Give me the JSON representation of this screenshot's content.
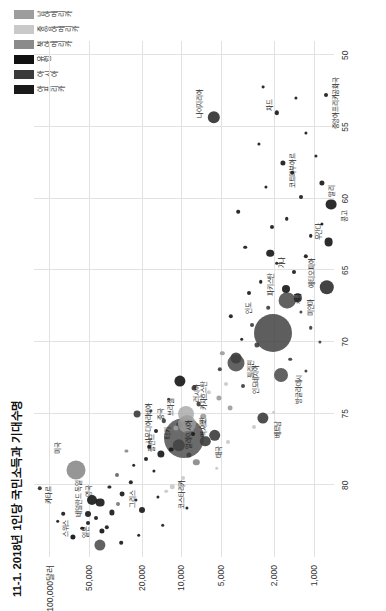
{
  "title": "11-1. 2018년 1인당 국민소득과 기대수명",
  "legend": {
    "position": "top-right",
    "items": [
      {
        "label": "아프리카",
        "color": "#1a1a1a"
      },
      {
        "label": "아시아",
        "color": "#3a3a3a"
      },
      {
        "label": "유럽",
        "color": "#111111"
      },
      {
        "label": "북아메리카",
        "color": "#8a8a8a"
      },
      {
        "label": "중앙아메리카",
        "color": "#c9c9c9"
      },
      {
        "label": "남아메리카",
        "color": "#9d9d9d"
      }
    ]
  },
  "chart_data": {
    "type": "scatter",
    "title": "11-1. 2018년 1인당 국민소득과 기대수명",
    "xlabel": "기대수명",
    "ylabel": "1인당 국민소득",
    "xlim": [
      49,
      85
    ],
    "ylim": [
      700,
      130000
    ],
    "yscale": "log",
    "grid": true,
    "xtick_labels": [
      "80",
      "75",
      "70",
      "65",
      "60",
      "55",
      "50"
    ],
    "xticks": [
      80,
      75,
      70,
      65,
      60,
      55,
      50
    ],
    "ytick_labels": [
      "1,000",
      "2,000",
      "5,000",
      "10,000",
      "20,000",
      "50,000",
      "100,000달러"
    ],
    "yticks": [
      1000,
      2000,
      5000,
      10000,
      20000,
      50000,
      100000
    ],
    "bubble_meaning": "원 크기는 인구 규모",
    "points": [
      {
        "name": "카타르",
        "x": 80.2,
        "y": 118000,
        "r": 2.2,
        "color": "#2b2b2b",
        "label": true,
        "lx": -1.1,
        "ly": 1.35
      },
      {
        "name": "스위스",
        "x": 83.6,
        "y": 66000,
        "r": 2.6,
        "color": "#111111",
        "label": true,
        "lx": 1.3,
        "ly": -1.2
      },
      {
        "name": "미국",
        "x": 78.9,
        "y": 63000,
        "r": 9.5,
        "color": "#7f7f7f",
        "label": true,
        "lx": 1.6,
        "ly": -1.4
      },
      {
        "name": "일본",
        "x": 84.2,
        "y": 41000,
        "r": 5.6,
        "color": "#555555",
        "label": true,
        "lx": 1.4,
        "ly": -1.6
      },
      {
        "name": "독일",
        "x": 81.0,
        "y": 47500,
        "r": 5.0,
        "color": "#1a1a1a",
        "label": true,
        "lx": 1.5,
        "ly": -1.5
      },
      {
        "name": "영국",
        "x": 81.2,
        "y": 41300,
        "r": 4.4,
        "color": "#1a1a1a",
        "label": true,
        "lx": 1.4,
        "ly": -1.4
      },
      {
        "name": "네덜란드",
        "x": 82.0,
        "y": 51000,
        "r": 3.0,
        "color": "#1a1a1a",
        "label": true,
        "lx": 1.3,
        "ly": -1.4
      },
      {
        "name": "그리스",
        "x": 81.7,
        "y": 19800,
        "r": 3.0,
        "color": "#1a1a1a",
        "label": true,
        "lx": 1.5,
        "ly": -1.5
      },
      {
        "name": "사우디아라비아",
        "x": 75.0,
        "y": 21600,
        "r": 3.4,
        "color": "#3f3f3f",
        "label": true,
        "lx": -1.3,
        "ly": 1.5
      },
      {
        "name": "폴란드",
        "x": 77.8,
        "y": 14200,
        "r": 3.6,
        "color": "#1a1a1a",
        "label": true,
        "lx": 1.4,
        "ly": -1.4
      },
      {
        "name": "말레이시아",
        "x": 75.8,
        "y": 10500,
        "r": 3.0,
        "color": "#3f3f3f",
        "label": true,
        "lx": -1.3,
        "ly": 1.4
      },
      {
        "name": "러시아",
        "x": 72.7,
        "y": 10200,
        "r": 5.6,
        "color": "#1a1a1a",
        "label": true,
        "lx": -1.3,
        "ly": 1.6
      },
      {
        "name": "카자흐스탄",
        "x": 73.2,
        "y": 8000,
        "r": 2.5,
        "color": "#3f3f3f",
        "label": true,
        "lx": -1.2,
        "ly": 1.4
      },
      {
        "name": "코스타리카",
        "x": 80.1,
        "y": 11700,
        "r": 2.2,
        "color": "#c9c9c9",
        "label": true,
        "lx": -1.2,
        "ly": 1.4
      },
      {
        "name": "중국",
        "x": 76.7,
        "y": 9500,
        "r": 20.0,
        "color": "#4a4a4a",
        "label": true,
        "lx": 1.0,
        "ly": -1.0
      },
      {
        "name": "터키",
        "x": 77.2,
        "y": 10400,
        "r": 6.2,
        "color": "#3f3f3f",
        "label": true,
        "lx": 1.2,
        "ly": -1.2
      },
      {
        "name": "멕시코",
        "x": 75.0,
        "y": 9200,
        "r": 8.0,
        "color": "#a8a8a8",
        "label": true,
        "lx": -1.2,
        "ly": 1.4
      },
      {
        "name": "태국",
        "x": 76.9,
        "y": 6600,
        "r": 5.2,
        "color": "#3f3f3f",
        "label": true,
        "lx": -1.2,
        "ly": 1.4
      },
      {
        "name": "브라질",
        "x": 75.7,
        "y": 9100,
        "r": 9.0,
        "color": "#9d9d9d",
        "label": true,
        "lx": 1.3,
        "ly": -1.3
      },
      {
        "name": "인도네시아",
        "x": 71.5,
        "y": 3850,
        "r": 8.5,
        "color": "#3f3f3f",
        "label": true,
        "lx": -1.3,
        "ly": 1.5
      },
      {
        "name": "이란",
        "x": 76.5,
        "y": 5600,
        "r": 5.8,
        "color": "#3f3f3f",
        "label": true,
        "lx": 1.2,
        "ly": -1.3
      },
      {
        "name": "인도",
        "x": 69.4,
        "y": 2020,
        "r": 19.0,
        "color": "#3a3a3a",
        "label": true,
        "lx": 1.1,
        "ly": -1.1
      },
      {
        "name": "필리핀",
        "x": 71.1,
        "y": 3830,
        "r": 5.5,
        "color": "#3f3f3f",
        "label": true,
        "lx": -1.2,
        "ly": 1.4
      },
      {
        "name": "베트남",
        "x": 75.3,
        "y": 2400,
        "r": 5.6,
        "color": "#3f3f3f",
        "label": true,
        "lx": -1.2,
        "ly": 1.4
      },
      {
        "name": "방글라데시",
        "x": 72.3,
        "y": 1750,
        "r": 7.0,
        "color": "#3f3f3f",
        "label": true,
        "lx": -1.3,
        "ly": 1.5
      },
      {
        "name": "파키스탄",
        "x": 67.1,
        "y": 1580,
        "r": 8.4,
        "color": "#3f3f3f",
        "label": true,
        "lx": 1.3,
        "ly": -1.4
      },
      {
        "name": "미얀마",
        "x": 66.9,
        "y": 1310,
        "r": 4.2,
        "color": "#3f3f3f",
        "label": true,
        "lx": -1.2,
        "ly": 1.4
      },
      {
        "name": "나이지리아",
        "x": 54.3,
        "y": 5700,
        "r": 6.2,
        "color": "#1a1a1a",
        "label": true,
        "lx": 1.3,
        "ly": -1.4
      },
      {
        "name": "케냐",
        "x": 66.3,
        "y": 1620,
        "r": 4.0,
        "color": "#1a1a1a",
        "label": true,
        "lx": -1.2,
        "ly": 1.4
      },
      {
        "name": "코트디부아르",
        "x": 57.5,
        "y": 1700,
        "r": 2.6,
        "color": "#1a1a1a",
        "label": true,
        "lx": -1.2,
        "ly": 1.4
      },
      {
        "name": "가나",
        "x": 63.8,
        "y": 2130,
        "r": 3.8,
        "color": "#1a1a1a",
        "label": true,
        "lx": -1.2,
        "ly": 1.4
      },
      {
        "name": "에티오피아",
        "x": 66.2,
        "y": 790,
        "r": 7.2,
        "color": "#1a1a1a",
        "label": true,
        "lx": 1.3,
        "ly": -1.4
      },
      {
        "name": "우간다",
        "x": 63.0,
        "y": 770,
        "r": 4.4,
        "color": "#1a1a1a",
        "label": true,
        "lx": 1.2,
        "ly": -1.3
      },
      {
        "name": "콩고",
        "x": 60.4,
        "y": 740,
        "r": 5.4,
        "color": "#1a1a1a",
        "label": true,
        "lx": -1.2,
        "ly": 1.4
      },
      {
        "name": "말리",
        "x": 58.9,
        "y": 870,
        "r": 2.6,
        "color": "#1a1a1a",
        "label": true,
        "lx": -1.2,
        "ly": 1.4
      },
      {
        "name": "차드",
        "x": 54.0,
        "y": 1900,
        "r": 2.2,
        "color": "#1a1a1a",
        "label": true,
        "lx": 1.2,
        "ly": -1.3
      },
      {
        "name": "중앙아프리카공화국",
        "x": 52.8,
        "y": 800,
        "r": 2.0,
        "color": "#1a1a1a",
        "label": true,
        "lx": -1.3,
        "ly": 1.5
      },
      {
        "name": "",
        "x": 82.5,
        "y": 86000,
        "r": 1.8,
        "color": "#1a1a1a",
        "label": false
      },
      {
        "name": "",
        "x": 82.0,
        "y": 78000,
        "r": 1.8,
        "color": "#1a1a1a",
        "label": false
      },
      {
        "name": "",
        "x": 83.0,
        "y": 56000,
        "r": 1.8,
        "color": "#1a1a1a",
        "label": false
      },
      {
        "name": "",
        "x": 82.6,
        "y": 50500,
        "r": 2.0,
        "color": "#1a1a1a",
        "label": false
      },
      {
        "name": "",
        "x": 82.3,
        "y": 44000,
        "r": 2.0,
        "color": "#1a1a1a",
        "label": false
      },
      {
        "name": "",
        "x": 83.2,
        "y": 40000,
        "r": 2.6,
        "color": "#141414",
        "label": false
      },
      {
        "name": "",
        "x": 82.9,
        "y": 36500,
        "r": 2.2,
        "color": "#1a1a1a",
        "label": false
      },
      {
        "name": "",
        "x": 81.9,
        "y": 33500,
        "r": 2.6,
        "color": "#1a1a1a",
        "label": false
      },
      {
        "name": "",
        "x": 81.3,
        "y": 30000,
        "r": 2.0,
        "color": "#777777",
        "label": false
      },
      {
        "name": "",
        "x": 80.6,
        "y": 28000,
        "r": 2.4,
        "color": "#1a1a1a",
        "label": false
      },
      {
        "name": "",
        "x": 80.1,
        "y": 35000,
        "r": 1.6,
        "color": "#1a1a1a",
        "label": false
      },
      {
        "name": "",
        "x": 79.3,
        "y": 30500,
        "r": 2.0,
        "color": "#666666",
        "label": false
      },
      {
        "name": "",
        "x": 79.8,
        "y": 24000,
        "r": 2.2,
        "color": "#1a1a1a",
        "label": false
      },
      {
        "name": "",
        "x": 78.6,
        "y": 23000,
        "r": 1.8,
        "color": "#1a1a1a",
        "label": false
      },
      {
        "name": "",
        "x": 81.0,
        "y": 22000,
        "r": 1.6,
        "color": "#1a1a1a",
        "label": false
      },
      {
        "name": "",
        "x": 78.2,
        "y": 18500,
        "r": 2.0,
        "color": "#1a1a1a",
        "label": false
      },
      {
        "name": "",
        "x": 77.3,
        "y": 17500,
        "r": 1.8,
        "color": "#1a1a1a",
        "label": false
      },
      {
        "name": "",
        "x": 79.0,
        "y": 16000,
        "r": 1.6,
        "color": "#1a1a1a",
        "label": false
      },
      {
        "name": "",
        "x": 76.2,
        "y": 15500,
        "r": 2.0,
        "color": "#1a1a1a",
        "label": false
      },
      {
        "name": "",
        "x": 80.8,
        "y": 15000,
        "r": 1.6,
        "color": "#1a1a1a",
        "label": false
      },
      {
        "name": "",
        "x": 75.5,
        "y": 13500,
        "r": 2.2,
        "color": "#3f3f3f",
        "label": false
      },
      {
        "name": "",
        "x": 74.8,
        "y": 17000,
        "r": 1.6,
        "color": "#3f3f3f",
        "label": false
      },
      {
        "name": "",
        "x": 74.0,
        "y": 12500,
        "r": 1.8,
        "color": "#3f3f3f",
        "label": false
      },
      {
        "name": "",
        "x": 77.5,
        "y": 12000,
        "r": 2.4,
        "color": "#1a1a1a",
        "label": false
      },
      {
        "name": "",
        "x": 76.0,
        "y": 11000,
        "r": 2.6,
        "color": "#9d9d9d",
        "label": false
      },
      {
        "name": "",
        "x": 75.2,
        "y": 6800,
        "r": 2.8,
        "color": "#9d9d9d",
        "label": false
      },
      {
        "name": "",
        "x": 74.3,
        "y": 7400,
        "r": 2.4,
        "color": "#3f3f3f",
        "label": false
      },
      {
        "name": "",
        "x": 73.5,
        "y": 6200,
        "r": 2.2,
        "color": "#c9c9c9",
        "label": false
      },
      {
        "name": "",
        "x": 77.9,
        "y": 8800,
        "r": 2.6,
        "color": "#3f3f3f",
        "label": false
      },
      {
        "name": "",
        "x": 78.4,
        "y": 7700,
        "r": 3.2,
        "color": "#8a8a8a",
        "label": false
      },
      {
        "name": "",
        "x": 76.4,
        "y": 8200,
        "r": 2.0,
        "color": "#1a1a1a",
        "label": false
      },
      {
        "name": "",
        "x": 73.9,
        "y": 5200,
        "r": 2.6,
        "color": "#9d9d9d",
        "label": false
      },
      {
        "name": "",
        "x": 72.9,
        "y": 4600,
        "r": 2.0,
        "color": "#c9c9c9",
        "label": false
      },
      {
        "name": "",
        "x": 71.9,
        "y": 5100,
        "r": 2.2,
        "color": "#3f3f3f",
        "label": false
      },
      {
        "name": "",
        "x": 74.6,
        "y": 4300,
        "r": 2.4,
        "color": "#9d9d9d",
        "label": false
      },
      {
        "name": "",
        "x": 73.1,
        "y": 3400,
        "r": 2.0,
        "color": "#3f3f3f",
        "label": false
      },
      {
        "name": "",
        "x": 70.8,
        "y": 4900,
        "r": 2.2,
        "color": "#9d9d9d",
        "label": false
      },
      {
        "name": "",
        "x": 70.2,
        "y": 2700,
        "r": 2.6,
        "color": "#3f3f3f",
        "label": false
      },
      {
        "name": "",
        "x": 69.8,
        "y": 3500,
        "r": 1.8,
        "color": "#1a1a1a",
        "label": false
      },
      {
        "name": "",
        "x": 68.8,
        "y": 2900,
        "r": 2.0,
        "color": "#3f3f3f",
        "label": false
      },
      {
        "name": "",
        "x": 68.2,
        "y": 4200,
        "r": 2.2,
        "color": "#1a1a1a",
        "label": false
      },
      {
        "name": "",
        "x": 67.6,
        "y": 2200,
        "r": 1.8,
        "color": "#3f3f3f",
        "label": false
      },
      {
        "name": "",
        "x": 66.6,
        "y": 3100,
        "r": 2.0,
        "color": "#1a1a1a",
        "label": false
      },
      {
        "name": "",
        "x": 65.8,
        "y": 2500,
        "r": 1.8,
        "color": "#1a1a1a",
        "label": false
      },
      {
        "name": "",
        "x": 65.1,
        "y": 1400,
        "r": 2.0,
        "color": "#1a1a1a",
        "label": false
      },
      {
        "name": "",
        "x": 64.5,
        "y": 1900,
        "r": 1.8,
        "color": "#1a1a1a",
        "label": false
      },
      {
        "name": "",
        "x": 64.0,
        "y": 1150,
        "r": 2.2,
        "color": "#1a1a1a",
        "label": false
      },
      {
        "name": "",
        "x": 63.4,
        "y": 3300,
        "r": 1.8,
        "color": "#1a1a1a",
        "label": false
      },
      {
        "name": "",
        "x": 62.6,
        "y": 1050,
        "r": 1.8,
        "color": "#1a1a1a",
        "label": false
      },
      {
        "name": "",
        "x": 62.0,
        "y": 2050,
        "r": 2.0,
        "color": "#1a1a1a",
        "label": false
      },
      {
        "name": "",
        "x": 61.4,
        "y": 1600,
        "r": 1.8,
        "color": "#1a1a1a",
        "label": false
      },
      {
        "name": "",
        "x": 60.9,
        "y": 3700,
        "r": 1.8,
        "color": "#1a1a1a",
        "label": false
      },
      {
        "name": "",
        "x": 59.9,
        "y": 1250,
        "r": 2.0,
        "color": "#1a1a1a",
        "label": false
      },
      {
        "name": "",
        "x": 59.2,
        "y": 2300,
        "r": 1.6,
        "color": "#1a1a1a",
        "label": false
      },
      {
        "name": "",
        "x": 58.2,
        "y": 1450,
        "r": 1.8,
        "color": "#1a1a1a",
        "label": false
      },
      {
        "name": "",
        "x": 57.0,
        "y": 960,
        "r": 1.6,
        "color": "#1a1a1a",
        "label": false
      },
      {
        "name": "",
        "x": 56.2,
        "y": 2600,
        "r": 1.6,
        "color": "#1a1a1a",
        "label": false
      },
      {
        "name": "",
        "x": 55.4,
        "y": 1150,
        "r": 1.6,
        "color": "#1a1a1a",
        "label": false
      },
      {
        "name": "",
        "x": 61.8,
        "y": 870,
        "r": 1.6,
        "color": "#1a1a1a",
        "label": false
      },
      {
        "name": "",
        "x": 67.9,
        "y": 1250,
        "r": 1.6,
        "color": "#3f3f3f",
        "label": false
      },
      {
        "name": "",
        "x": 69.0,
        "y": 1050,
        "r": 1.8,
        "color": "#3f3f3f",
        "label": false
      },
      {
        "name": "",
        "x": 71.2,
        "y": 1500,
        "r": 1.8,
        "color": "#3f3f3f",
        "label": false
      },
      {
        "name": "",
        "x": 72.0,
        "y": 1150,
        "r": 1.6,
        "color": "#3f3f3f",
        "label": false
      },
      {
        "name": "",
        "x": 70.0,
        "y": 900,
        "r": 1.6,
        "color": "#3f3f3f",
        "label": false
      },
      {
        "name": "",
        "x": 79.5,
        "y": 9800,
        "r": 2.0,
        "color": "#c9c9c9",
        "label": false
      },
      {
        "name": "",
        "x": 78.8,
        "y": 5400,
        "r": 1.8,
        "color": "#c9c9c9",
        "label": false
      },
      {
        "name": "",
        "x": 77.0,
        "y": 4400,
        "r": 2.0,
        "color": "#c9c9c9",
        "label": false
      },
      {
        "name": "",
        "x": 75.9,
        "y": 2800,
        "r": 2.0,
        "color": "#c9c9c9",
        "label": false
      },
      {
        "name": "",
        "x": 74.9,
        "y": 2000,
        "r": 1.8,
        "color": "#c9c9c9",
        "label": false
      },
      {
        "name": "",
        "x": 80.4,
        "y": 13000,
        "r": 1.8,
        "color": "#c9c9c9",
        "label": false
      },
      {
        "name": "",
        "x": 77.6,
        "y": 26000,
        "r": 1.6,
        "color": "#8a8a8a",
        "label": false
      },
      {
        "name": "",
        "x": 84.0,
        "y": 28500,
        "r": 1.8,
        "color": "#1a1a1a",
        "label": false
      },
      {
        "name": "",
        "x": 83.5,
        "y": 21000,
        "r": 1.8,
        "color": "#1a1a1a",
        "label": false
      },
      {
        "name": "",
        "x": 82.8,
        "y": 13800,
        "r": 1.8,
        "color": "#1a1a1a",
        "label": false
      },
      {
        "name": "",
        "x": 81.6,
        "y": 9000,
        "r": 1.6,
        "color": "#1a1a1a",
        "label": false
      },
      {
        "name": "",
        "x": 53.0,
        "y": 1350,
        "r": 1.6,
        "color": "#1a1a1a",
        "label": false
      },
      {
        "name": "",
        "x": 52.2,
        "y": 2400,
        "r": 1.4,
        "color": "#1a1a1a",
        "label": false
      }
    ]
  }
}
